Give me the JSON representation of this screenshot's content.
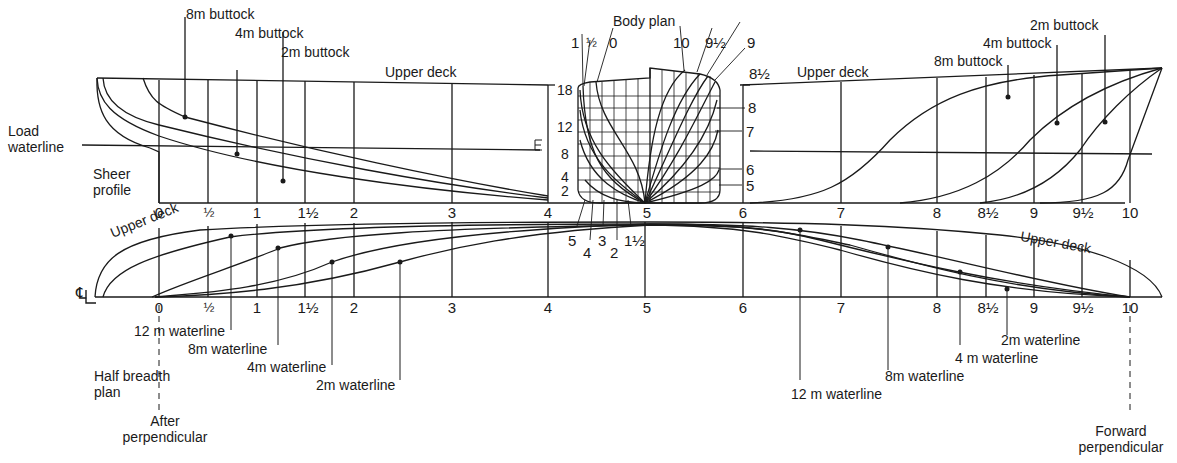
{
  "views": {
    "sheer_profile": {
      "label": "Sheer profile",
      "upper_deck_label_aft": "Upper deck",
      "upper_deck_label_fwd": "Upper deck",
      "load_waterline_label": "Load waterline",
      "buttocks_aft": [
        "8m buttock",
        "4m buttock",
        "2m buttock"
      ],
      "buttocks_fwd": [
        "8m buttock",
        "4m buttock",
        "2m buttock"
      ]
    },
    "body_plan": {
      "label": "Body plan",
      "waterline_ticks": [
        "18",
        "12",
        "8",
        "4",
        "2"
      ],
      "aft_station_labels_top": [
        "1",
        "½",
        "0"
      ],
      "fwd_station_labels_top": [
        "10",
        "9½",
        "9",
        "8½"
      ],
      "fwd_station_labels_side": [
        "8",
        "7",
        "6",
        "5"
      ],
      "aft_station_labels_bottom": [
        "5",
        "4",
        "3",
        "2",
        "1½"
      ]
    },
    "half_breadth_plan": {
      "label": "Half breadth plan",
      "upper_deck_label_aft": "Upper deck",
      "upper_deck_label_fwd": "Upper deck",
      "centerline_symbol": "℄",
      "waterlines_aft": [
        "12 m waterline",
        "8m waterline",
        "4m waterline",
        "2m waterline"
      ],
      "waterlines_fwd": [
        "12 m waterline",
        "8m waterline",
        "4 m waterline",
        "2m waterline"
      ]
    }
  },
  "stations": [
    "0",
    "½",
    "1",
    "1½",
    "2",
    "3",
    "4",
    "5",
    "6",
    "7",
    "8",
    "8½",
    "9",
    "9½",
    "10"
  ],
  "perpendiculars": {
    "aft": "After perpendicular",
    "forward": "Forward perpendicular"
  }
}
